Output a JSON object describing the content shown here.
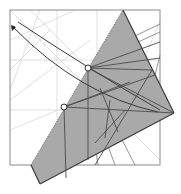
{
  "diagram": {
    "type": "origami-crease-pattern-step",
    "colors": {
      "background": "#ffffff",
      "paper_outline": "#8a8a8a",
      "faint_crease": "#d8d8d8",
      "flap_fill": "#a9a9a9",
      "flap_edge": "#3a3a3a",
      "crease": "#4a4a4a",
      "arrow": "#3a3a3a",
      "reference_point": "#333333"
    },
    "paper_square": {
      "x": 10,
      "y": 10,
      "size": 150
    },
    "flap_polygon": [
      [
        123,
        10
      ],
      [
        174,
        113
      ],
      [
        40,
        184
      ],
      [
        31,
        165
      ]
    ],
    "reference_points": [
      {
        "label": "upper",
        "x": 88,
        "y": 68
      },
      {
        "label": "lower",
        "x": 64,
        "y": 107
      }
    ],
    "fold_arrow": {
      "head": {
        "x": 13,
        "y": 28
      }
    }
  }
}
